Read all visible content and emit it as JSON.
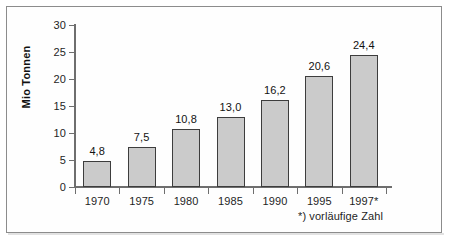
{
  "chart_data": {
    "type": "bar",
    "title": "",
    "xlabel": "",
    "ylabel": "Mio Tonnen",
    "categories": [
      "1970",
      "1975",
      "1980",
      "1985",
      "1990",
      "1995",
      "1997*"
    ],
    "values": [
      4.8,
      7.5,
      10.8,
      13.0,
      16.2,
      20.6,
      24.4
    ],
    "value_labels": [
      "4,8",
      "7,5",
      "10,8",
      "13,0",
      "16,2",
      "20,6",
      "24,4"
    ],
    "ylim": [
      0,
      30
    ],
    "ytick_labels": [
      "0",
      "5",
      "10",
      "15",
      "20",
      "25",
      "30"
    ],
    "ytick_values": [
      0,
      5,
      10,
      15,
      20,
      25,
      30
    ],
    "grid": false,
    "legend": "none",
    "annotations": [
      "*) vorläufige Zahl"
    ],
    "bar_fill_color": "#cbcbcb",
    "bar_border_color": "#3d3d3d",
    "axis_color": "#6e6e6e",
    "text_color": "#1f1f1f",
    "frame_color": "#8c8c8c",
    "background_color": "#ffffff"
  },
  "footnote": {
    "text": "*) vorläufige Zahl"
  }
}
